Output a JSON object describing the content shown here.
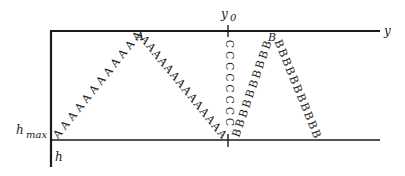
{
  "diagram": {
    "type": "seismic-ray-path-schematic",
    "colors": {
      "ink": "#1a1a1a",
      "background": "#ffffff"
    },
    "axes": {
      "y_axis_label": "y",
      "h_axis_label": "h",
      "hmax_label": {
        "main": "h",
        "sub": "max"
      },
      "y0_label": {
        "main": "y",
        "sub": "0"
      }
    },
    "paths": [
      {
        "name": "A",
        "char": "A",
        "segments": [
          {
            "from": [
              58,
              134
            ],
            "to": [
              137,
              36
            ],
            "count": 12,
            "angle": -50
          },
          {
            "from": [
              145,
              40
            ],
            "to": [
              222,
              134
            ],
            "count": 14,
            "angle": 50
          }
        ],
        "peak_char": "A",
        "peak": [
          140,
          36
        ]
      },
      {
        "name": "C",
        "char": "C",
        "segments": [
          {
            "from": [
              229,
              44
            ],
            "to": [
              229,
              122
            ],
            "count": 8,
            "angle": 90
          }
        ]
      },
      {
        "name": "B",
        "char": "B",
        "segments": [
          {
            "from": [
              237,
              133
            ],
            "to": [
              267,
              45
            ],
            "count": 10,
            "angle": -71
          },
          {
            "from": [
              279,
              44
            ],
            "to": [
              316,
              134
            ],
            "count": 11,
            "angle": 68
          }
        ],
        "peak_char": "B",
        "peak": [
          272,
          37
        ]
      }
    ]
  }
}
